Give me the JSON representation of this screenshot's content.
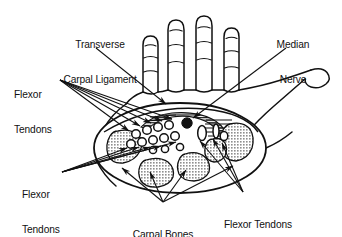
{
  "figure": {
    "kind": "anatomical-diagram",
    "view": "palmar oblique cross-section through the wrist",
    "background_color": "#ffffff",
    "ink_color": "#111111",
    "width": 342,
    "height": 237
  },
  "labels": {
    "transverse_carpal_ligament": {
      "line1": "Transverse",
      "line2": "Carpal Ligament"
    },
    "median_nerve": {
      "line1": "Median",
      "line2": "Nerve"
    },
    "flexor_tendons_upper": {
      "line1": "Flexor",
      "line2": "Tendons"
    },
    "flexor_tendons_lower": {
      "line1": "Flexor",
      "line2": "Tendons"
    },
    "carpal_bones": {
      "line1": "Carpal Bones"
    },
    "flexor_tendons_thumb": {
      "line1": "Flexor Tendons",
      "line2": "(Thumb)"
    }
  },
  "structures": {
    "median_nerve_marker": {
      "name": "median-nerve",
      "style": "solid black filled circle",
      "color": "#111111"
    },
    "flexor_tendon_markers": {
      "name": "flexor-tendons",
      "style": "open white circles with black outline",
      "count": 12,
      "fill": "#ffffff",
      "stroke": "#111111"
    },
    "flexor_tendon_thumb_markers": {
      "name": "flexor-tendons-thumb",
      "style": "open white ellipses with black outline",
      "count": 3,
      "fill": "#ffffff",
      "stroke": "#111111"
    },
    "carpal_bone_shapes": {
      "name": "carpal-bones",
      "style": "stippled grey blobs",
      "count": 5,
      "fill": "#a8a8a8",
      "stroke": "#111111"
    },
    "transverse_carpal_ligament_band": {
      "name": "transverse-carpal-ligament",
      "style": "horizontally hatched band arching over the tunnel",
      "stroke": "#111111"
    },
    "hand_outline": {
      "name": "hand-outline",
      "style": "line drawing of four fingers, palm and thumb",
      "stroke": "#111111"
    },
    "tunnel_oval": {
      "name": "carpal-tunnel-oval",
      "style": "large ellipse enclosing the cross-section",
      "stroke": "#111111"
    }
  },
  "leader_lines": {
    "style": "thin straight lines ending in solid arrowheads",
    "color": "#111111",
    "groups": [
      {
        "from": "transverse_carpal_ligament",
        "targets": 1
      },
      {
        "from": "median_nerve",
        "targets": 1
      },
      {
        "from": "flexor_tendons_upper",
        "targets": 5
      },
      {
        "from": "flexor_tendons_lower",
        "targets": 5
      },
      {
        "from": "carpal_bones",
        "targets": 4
      },
      {
        "from": "flexor_tendons_thumb",
        "targets": 3
      }
    ]
  }
}
